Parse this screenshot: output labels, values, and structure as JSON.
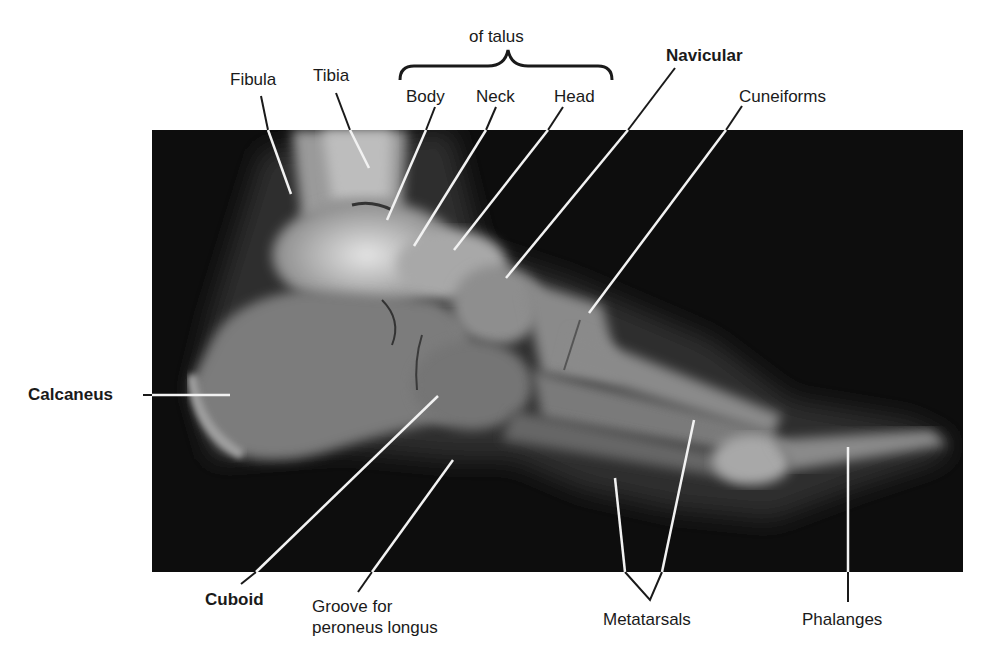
{
  "figure": {
    "background_color": "#ffffff",
    "xray_color": "#0d0d0d",
    "label_color": "#1a1a1a",
    "leader_line_color_inside": "#ffffff",
    "leader_line_color_outside": "#1a1a1a"
  },
  "labels": {
    "fibula": "Fibula",
    "tibia": "Tibia",
    "of_talus": "of talus",
    "body": "Body",
    "neck": "Neck",
    "head": "Head",
    "navicular": "Navicular",
    "cuneiforms": "Cuneiforms",
    "calcaneus": "Calcaneus",
    "cuboid": "Cuboid",
    "groove_line1": "Groove for",
    "groove_line2": "peroneus longus",
    "metatarsals": "Metatarsals",
    "phalanges": "Phalanges"
  },
  "bold_labels": [
    "Navicular",
    "Calcaneus",
    "Cuboid"
  ],
  "brace_group": {
    "title": "of talus",
    "members": [
      "Body",
      "Neck",
      "Head"
    ]
  }
}
